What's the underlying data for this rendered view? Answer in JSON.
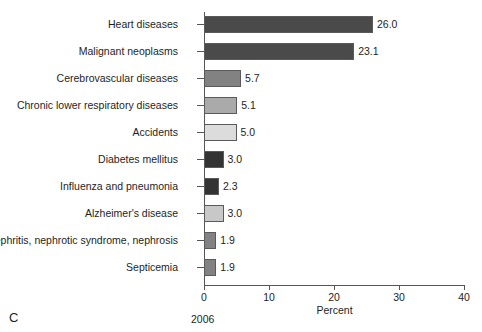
{
  "panel": {
    "letter": "C",
    "year": "2006"
  },
  "chart_data": {
    "type": "bar",
    "orientation": "horizontal",
    "title": "",
    "xlabel": "Percent",
    "ylabel": "",
    "xlim": [
      0,
      40
    ],
    "xticks": [
      0,
      10,
      20,
      30,
      40
    ],
    "xtick_labels": [
      "0",
      "10",
      "20",
      "30",
      "40"
    ],
    "grid": false,
    "legend": false,
    "categories": [
      "Heart diseases",
      "Malignant neoplasms",
      "Cerebrovascular diseases",
      "Chronic lower respiratory diseases",
      "Accidents",
      "Diabetes mellitus",
      "Influenza and pneumonia",
      "Alzheimer's disease",
      "Nephritis, nephrotic syndrome, nephrosis",
      "Septicemia"
    ],
    "values": [
      26.0,
      23.1,
      5.7,
      5.1,
      5.0,
      3.0,
      2.3,
      3.0,
      1.9,
      1.9
    ],
    "value_labels": [
      "26.0",
      "23.1",
      "5.7",
      "5.1",
      "5.0",
      "3.0",
      "2.3",
      "3.0",
      "1.9",
      "1.9"
    ],
    "bar_colors": [
      "#4a4a4a",
      "#4a4a4a",
      "#828282",
      "#aaaaaa",
      "#dcdcdc",
      "#333333",
      "#333333",
      "#c8c8c8",
      "#828282",
      "#828282"
    ],
    "bar_edge_color": "#5a5a5a",
    "axis_color": "#555555",
    "text_color": "#1e1e1e"
  }
}
